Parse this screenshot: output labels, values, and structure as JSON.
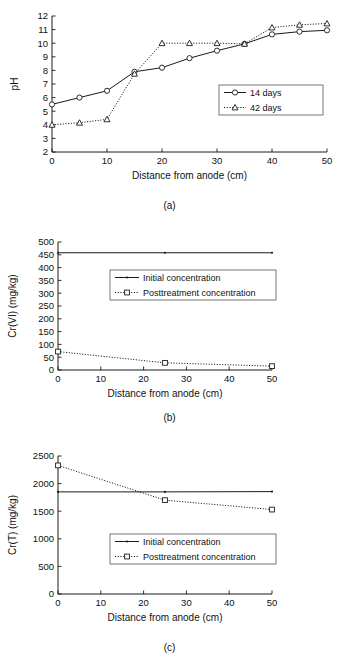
{
  "figure": {
    "panels": [
      {
        "id": "a",
        "caption": "(a)",
        "chart_data": {
          "type": "line",
          "title": "",
          "xlabel": "Distance from anode (cm)",
          "ylabel": "pH",
          "xlim": [
            0,
            50
          ],
          "ylim": [
            2,
            12
          ],
          "xticks": [
            0,
            10,
            20,
            30,
            40,
            50
          ],
          "xticklabels": [
            "0",
            "10",
            "20",
            "30",
            "40",
            "50"
          ],
          "yticks": [
            2,
            3,
            4,
            5,
            6,
            7,
            8,
            9,
            10,
            11,
            12
          ],
          "yticklabels": [
            "2",
            "3",
            "4",
            "5",
            "6",
            "7",
            "8",
            "9",
            "10",
            "11",
            "12"
          ],
          "grid": false,
          "legend_position": "right-middle",
          "x": [
            0,
            5,
            10,
            15,
            20,
            25,
            30,
            35,
            40,
            45,
            50
          ],
          "series": [
            {
              "name": "14 days",
              "marker": "circle",
              "linestyle": "solid",
              "color": "#1a1a1a",
              "values": [
                5.5,
                6.0,
                6.5,
                7.9,
                8.2,
                8.9,
                9.45,
                9.95,
                10.65,
                10.85,
                10.95
              ]
            },
            {
              "name": "42 days",
              "marker": "triangle",
              "linestyle": "dotted",
              "color": "#1a1a1a",
              "values": [
                4.0,
                4.15,
                4.4,
                7.75,
                10.0,
                10.0,
                10.0,
                9.95,
                11.15,
                11.35,
                11.45
              ]
            }
          ]
        }
      },
      {
        "id": "b",
        "caption": "(b)",
        "chart_data": {
          "type": "line",
          "title": "",
          "xlabel": "Distance from anode (cm)",
          "ylabel": "Cr(VI) (mg/kg)",
          "xlim": [
            0,
            50
          ],
          "ylim": [
            0,
            500
          ],
          "xticks": [
            0,
            10,
            20,
            30,
            40,
            50
          ],
          "xticklabels": [
            "0",
            "10",
            "20",
            "30",
            "40",
            "50"
          ],
          "yticks": [
            0,
            50,
            100,
            150,
            200,
            250,
            300,
            350,
            400,
            450,
            500
          ],
          "yticklabels": [
            "0",
            "50",
            "100",
            "150",
            "200",
            "250",
            "300",
            "350",
            "400",
            "450",
            "500"
          ],
          "grid": false,
          "legend_position": "center",
          "x": [
            0,
            25,
            50
          ],
          "series": [
            {
              "name": "Initial concentration",
              "marker": "dot",
              "linestyle": "solid",
              "color": "#1a1a1a",
              "values": [
                458,
                458,
                458
              ]
            },
            {
              "name": "Posttreatment concentration",
              "marker": "square",
              "linestyle": "dotted",
              "color": "#1a1a1a",
              "values": [
                72,
                28,
                15
              ]
            }
          ]
        }
      },
      {
        "id": "c",
        "caption": "(c)",
        "chart_data": {
          "type": "line",
          "title": "",
          "xlabel": "Distance from anode (cm)",
          "ylabel": "Cr(T) (mg/kg)",
          "xlim": [
            0,
            50
          ],
          "ylim": [
            0,
            2500
          ],
          "xticks": [
            0,
            10,
            20,
            30,
            40,
            50
          ],
          "xticklabels": [
            "0",
            "10",
            "20",
            "30",
            "40",
            "50"
          ],
          "yticks": [
            0,
            500,
            1000,
            1500,
            2000,
            2500
          ],
          "yticklabels": [
            "0",
            "500",
            "1000",
            "1500",
            "2000",
            "2500"
          ],
          "grid": false,
          "legend_position": "center",
          "x": [
            0,
            25,
            50
          ],
          "series": [
            {
              "name": "Initial concentration",
              "marker": "dot",
              "linestyle": "solid",
              "color": "#1a1a1a",
              "values": [
                1850,
                1850,
                1855
              ]
            },
            {
              "name": "Posttreatment concentration",
              "marker": "square",
              "linestyle": "dotted",
              "color": "#1a1a1a",
              "values": [
                2330,
                1700,
                1530
              ]
            }
          ]
        }
      }
    ]
  }
}
